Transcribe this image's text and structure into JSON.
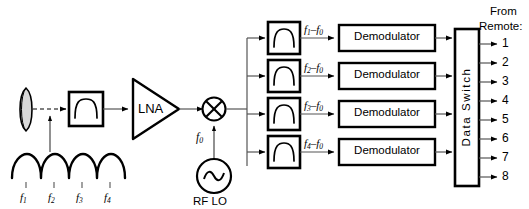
{
  "diagram": {
    "colors": {
      "stroke": "#000000",
      "thin_stroke": "#4d4d4d",
      "fill": "#ffffff",
      "lens_fill": "#d9d9d9",
      "text": "#000000"
    },
    "input": {
      "lens_name": "lens",
      "spectrum_label": "received multichannel spectrum",
      "channels": [
        {
          "id": "f1",
          "base": "f",
          "sub": "1"
        },
        {
          "id": "f2",
          "base": "f",
          "sub": "2"
        },
        {
          "id": "f3",
          "base": "f",
          "sub": "3"
        },
        {
          "id": "f4",
          "base": "f",
          "sub": "4"
        }
      ]
    },
    "front_end": {
      "bandpass_filter_label": "",
      "amplifier_label": "LNA",
      "mixer_label": "",
      "lo_label": "RF LO",
      "lo_freq_base": "f",
      "lo_freq_sub": "0"
    },
    "branches": [
      {
        "index": 1,
        "if_base": "f",
        "if_sub": "1",
        "if_minus": "–f",
        "if_sub2": "0",
        "demod_label": "Demodulator"
      },
      {
        "index": 2,
        "if_base": "f",
        "if_sub": "2",
        "if_minus": "–f",
        "if_sub2": "0",
        "demod_label": "Demodulator"
      },
      {
        "index": 3,
        "if_base": "f",
        "if_sub": "3",
        "if_minus": "–f",
        "if_sub2": "0",
        "demod_label": "Demodulator"
      },
      {
        "index": 4,
        "if_base": "f",
        "if_sub": "4",
        "if_minus": "–f",
        "if_sub2": "0",
        "demod_label": "Demodulator"
      }
    ],
    "switch": {
      "label": "Data Switch"
    },
    "outputs": {
      "header_line1": "From",
      "header_line2": "Remote:",
      "ports": [
        "1",
        "2",
        "3",
        "4",
        "5",
        "6",
        "7",
        "8"
      ]
    }
  }
}
